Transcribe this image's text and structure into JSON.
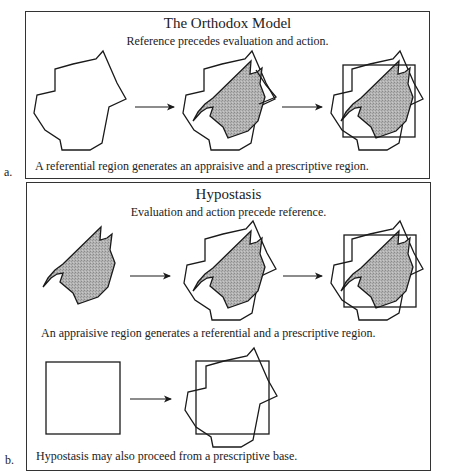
{
  "panel_a": {
    "label": "a.",
    "title": "The Orthodox Model",
    "subtitle": "Reference precedes evaluation and action.",
    "caption": "A referential region generates an appraisive and a prescriptive region."
  },
  "panel_b": {
    "label": "b.",
    "title": "Hypostasis",
    "subtitle": "Evaluation and action precede reference.",
    "caption_1": "An appraisive region generates a referential and a prescriptive region.",
    "caption_2": "Hypostasis may also proceed from a prescriptive base."
  },
  "colors": {
    "stroke": "#1a1a1a",
    "shade": "#a9a9a9",
    "border": "#333333"
  }
}
